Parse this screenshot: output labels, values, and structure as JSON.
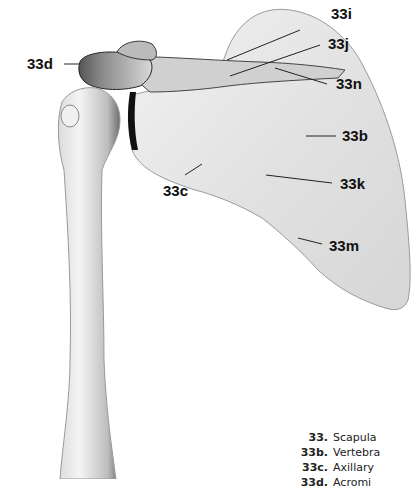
{
  "diagram": {
    "labels": [
      {
        "id": "33i",
        "text": "33i"
      },
      {
        "id": "33j",
        "text": "33j"
      },
      {
        "id": "33d",
        "text": "33d"
      },
      {
        "id": "33n",
        "text": "33n"
      },
      {
        "id": "33b",
        "text": "33b"
      },
      {
        "id": "33c",
        "text": "33c"
      },
      {
        "id": "33k",
        "text": "33k"
      },
      {
        "id": "33m",
        "text": "33m"
      }
    ]
  },
  "legend": [
    {
      "code": "33.",
      "name": "Scapula"
    },
    {
      "code": "33b.",
      "name": "Vertebra"
    },
    {
      "code": "33c.",
      "name": "Axillary"
    },
    {
      "code": "33d.",
      "name": "Acromi"
    }
  ]
}
